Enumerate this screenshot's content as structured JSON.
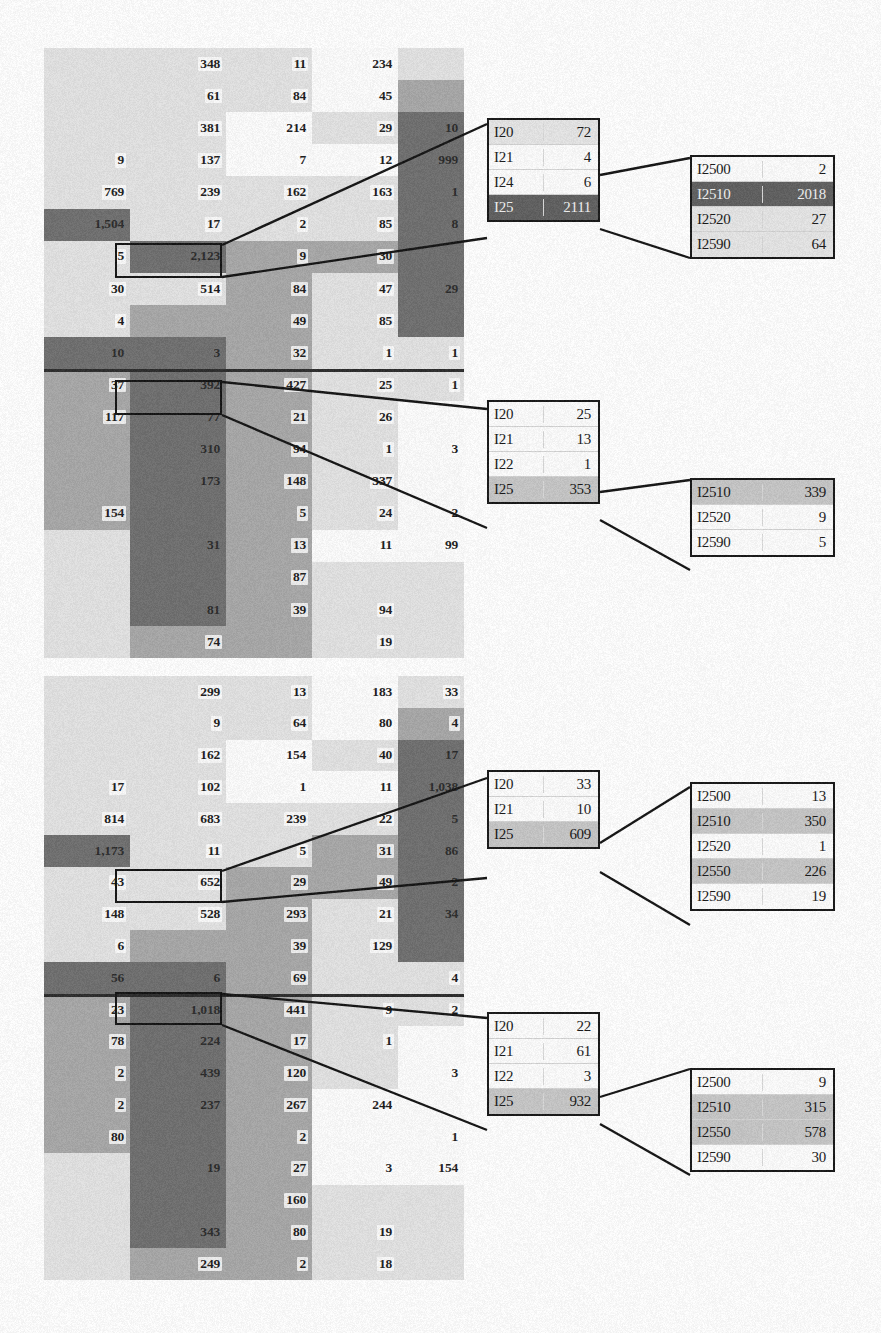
{
  "figure": {
    "palette": {
      "panel_bg": "#c9c9c9",
      "light": "#e3e3e3",
      "lighter": "#efefef",
      "white": "#fdfdfd",
      "mid": "#b6b6b6",
      "midgray": "#a8a8a8",
      "dark": "#6f6f6f",
      "darker": "#5d5d5d",
      "ink": "#161616",
      "highlight_border": "#111111"
    }
  },
  "panels": [
    {
      "name": "top-panel",
      "rows": 17,
      "cols": 5,
      "divider_after_row": 10,
      "grid": [
        [
          "",
          "348",
          "11",
          "234",
          ""
        ],
        [
          "",
          "61",
          "84",
          "45",
          ""
        ],
        [
          "",
          "381",
          "214",
          "29",
          "10"
        ],
        [
          "9",
          "137",
          "7",
          "12",
          "999"
        ],
        [
          "769",
          "239",
          "162",
          "163",
          "1"
        ],
        [
          "1,504",
          "17",
          "2",
          "85",
          "8"
        ],
        [
          "5",
          "2,123",
          "9",
          "30",
          ""
        ],
        [
          "30",
          "514",
          "84",
          "47",
          "29"
        ],
        [
          "4",
          "",
          "49",
          "85",
          ""
        ],
        [
          "10",
          "3",
          "32",
          "1",
          "1"
        ],
        [
          "37",
          "392",
          "427",
          "25",
          "1"
        ],
        [
          "117",
          "77",
          "21",
          "26",
          ""
        ],
        [
          "",
          "310",
          "94",
          "1",
          "3"
        ],
        [
          "",
          "173",
          "148",
          "337",
          ""
        ],
        [
          "154",
          "",
          "5",
          "24",
          "2"
        ],
        [
          "",
          "31",
          "13",
          "11",
          "99"
        ],
        [
          "",
          "",
          "87",
          "",
          ""
        ],
        [
          "",
          "81",
          "39",
          "94",
          ""
        ],
        [
          "",
          "74",
          "",
          "19",
          ""
        ]
      ]
    },
    {
      "name": "bottom-panel",
      "rows": 17,
      "cols": 5,
      "divider_after_row": 10,
      "grid": [
        [
          "",
          "299",
          "13",
          "183",
          "33"
        ],
        [
          "",
          "9",
          "64",
          "80",
          "4"
        ],
        [
          "",
          "162",
          "154",
          "40",
          "17"
        ],
        [
          "17",
          "102",
          "1",
          "11",
          "1,038"
        ],
        [
          "814",
          "683",
          "239",
          "22",
          "5"
        ],
        [
          "1,173",
          "11",
          "5",
          "31",
          "86"
        ],
        [
          "43",
          "652",
          "29",
          "49",
          "2"
        ],
        [
          "148",
          "528",
          "293",
          "21",
          "34"
        ],
        [
          "6",
          "",
          "39",
          "129",
          ""
        ],
        [
          "56",
          "6",
          "69",
          "",
          "4"
        ],
        [
          "23",
          "1,018",
          "441",
          "9",
          "2"
        ],
        [
          "78",
          "224",
          "17",
          "1",
          ""
        ],
        [
          "2",
          "439",
          "120",
          "",
          "3"
        ],
        [
          "2",
          "237",
          "267",
          "244",
          ""
        ],
        [
          "80",
          "",
          "2",
          "",
          "1"
        ],
        [
          "",
          "19",
          "27",
          "3",
          "154"
        ],
        [
          "",
          "",
          "160",
          "",
          ""
        ],
        [
          "",
          "343",
          "80",
          "19",
          ""
        ],
        [
          "",
          "249",
          "2",
          "18",
          ""
        ]
      ]
    }
  ],
  "callouts": [
    {
      "name": "callout-top-level1",
      "rows": [
        {
          "key": "I20",
          "value": "72",
          "shade": "light"
        },
        {
          "key": "I21",
          "value": "4",
          "shade": "white"
        },
        {
          "key": "I24",
          "value": "6",
          "shade": "white"
        },
        {
          "key": "I25",
          "value": "2111",
          "shade": "dark"
        }
      ]
    },
    {
      "name": "callout-top-level2",
      "rows": [
        {
          "key": "I2500",
          "value": "2",
          "shade": "white"
        },
        {
          "key": "I2510",
          "value": "2018",
          "shade": "dark"
        },
        {
          "key": "I2520",
          "value": "27",
          "shade": "light"
        },
        {
          "key": "I2590",
          "value": "64",
          "shade": "light"
        }
      ]
    },
    {
      "name": "callout-mid-level1",
      "rows": [
        {
          "key": "I20",
          "value": "25",
          "shade": "white"
        },
        {
          "key": "I21",
          "value": "13",
          "shade": "white"
        },
        {
          "key": "I22",
          "value": "1",
          "shade": "white"
        },
        {
          "key": "I25",
          "value": "353",
          "shade": "mid"
        }
      ]
    },
    {
      "name": "callout-mid-level2",
      "rows": [
        {
          "key": "I2510",
          "value": "339",
          "shade": "mid"
        },
        {
          "key": "I2520",
          "value": "9",
          "shade": "white"
        },
        {
          "key": "I2590",
          "value": "5",
          "shade": "white"
        }
      ]
    },
    {
      "name": "callout-lower-level1",
      "rows": [
        {
          "key": "I20",
          "value": "33",
          "shade": "white"
        },
        {
          "key": "I21",
          "value": "10",
          "shade": "white"
        },
        {
          "key": "I25",
          "value": "609",
          "shade": "mid"
        }
      ]
    },
    {
      "name": "callout-lower-level2",
      "rows": [
        {
          "key": "I2500",
          "value": "13",
          "shade": "white"
        },
        {
          "key": "I2510",
          "value": "350",
          "shade": "mid"
        },
        {
          "key": "I2520",
          "value": "1",
          "shade": "white"
        },
        {
          "key": "I2550",
          "value": "226",
          "shade": "mid"
        },
        {
          "key": "I2590",
          "value": "19",
          "shade": "white"
        }
      ]
    },
    {
      "name": "callout-bottom-level1",
      "rows": [
        {
          "key": "I20",
          "value": "22",
          "shade": "white"
        },
        {
          "key": "I21",
          "value": "61",
          "shade": "white"
        },
        {
          "key": "I22",
          "value": "3",
          "shade": "white"
        },
        {
          "key": "I25",
          "value": "932",
          "shade": "mid"
        }
      ]
    },
    {
      "name": "callout-bottom-level2",
      "rows": [
        {
          "key": "I2500",
          "value": "9",
          "shade": "white"
        },
        {
          "key": "I2510",
          "value": "315",
          "shade": "mid"
        },
        {
          "key": "I2550",
          "value": "578",
          "shade": "mid"
        },
        {
          "key": "I2590",
          "value": "30",
          "shade": "white"
        }
      ]
    }
  ],
  "chart_data": {
    "type": "heatmap",
    "xlabel": "",
    "ylabel": "",
    "grid": true,
    "legend_position": "none",
    "panels": [
      {
        "name": "top-panel",
        "columns": [
          "c1",
          "c2",
          "c3",
          "c4",
          "c5"
        ],
        "values": [
          [
            null,
            348,
            11,
            234,
            null
          ],
          [
            null,
            61,
            84,
            45,
            null
          ],
          [
            null,
            381,
            214,
            29,
            10
          ],
          [
            9,
            137,
            7,
            12,
            999
          ],
          [
            769,
            239,
            162,
            163,
            1
          ],
          [
            1504,
            17,
            2,
            85,
            8
          ],
          [
            5,
            2123,
            9,
            30,
            null
          ],
          [
            30,
            514,
            84,
            47,
            29
          ],
          [
            4,
            null,
            49,
            85,
            null
          ],
          [
            10,
            3,
            32,
            1,
            1
          ],
          [
            37,
            392,
            427,
            25,
            1
          ],
          [
            117,
            77,
            21,
            26,
            null
          ],
          [
            null,
            310,
            94,
            1,
            3
          ],
          [
            null,
            173,
            148,
            337,
            null
          ],
          [
            154,
            null,
            5,
            24,
            2
          ],
          [
            null,
            31,
            13,
            11,
            99
          ],
          [
            null,
            null,
            87,
            null,
            null
          ],
          [
            null,
            81,
            39,
            94,
            null
          ],
          [
            null,
            74,
            null,
            19,
            null
          ]
        ],
        "highlighted_cell": {
          "row": 6,
          "col": 1,
          "value": 2123
        }
      },
      {
        "name": "bottom-panel",
        "columns": [
          "c1",
          "c2",
          "c3",
          "c4",
          "c5"
        ],
        "values": [
          [
            null,
            299,
            13,
            183,
            33
          ],
          [
            null,
            9,
            64,
            80,
            4
          ],
          [
            null,
            162,
            154,
            40,
            17
          ],
          [
            17,
            102,
            1,
            11,
            1038
          ],
          [
            814,
            683,
            239,
            22,
            5
          ],
          [
            1173,
            11,
            5,
            31,
            86
          ],
          [
            43,
            652,
            29,
            49,
            2
          ],
          [
            148,
            528,
            293,
            21,
            34
          ],
          [
            6,
            null,
            39,
            129,
            null
          ],
          [
            56,
            6,
            69,
            null,
            4
          ],
          [
            23,
            1018,
            441,
            9,
            2
          ],
          [
            78,
            224,
            17,
            1,
            null
          ],
          [
            2,
            439,
            120,
            null,
            3
          ],
          [
            2,
            237,
            267,
            244,
            null
          ],
          [
            80,
            null,
            2,
            null,
            1
          ],
          [
            null,
            19,
            27,
            3,
            154
          ],
          [
            null,
            null,
            160,
            null,
            null
          ],
          [
            null,
            343,
            80,
            19,
            null
          ],
          [
            null,
            249,
            2,
            18,
            null
          ]
        ],
        "highlighted_cells": [
          {
            "row": 6,
            "col": 1,
            "value": 652
          },
          {
            "row": 10,
            "col": 1,
            "value": 1018
          }
        ]
      }
    ],
    "drilldowns": [
      {
        "from": "top-panel",
        "level1": {
          "I20": 72,
          "I21": 4,
          "I24": 6,
          "I25": 2111
        },
        "level2": {
          "I2500": 2,
          "I2510": 2018,
          "I2520": 27,
          "I2590": 64
        }
      },
      {
        "from": "top-panel",
        "level1": {
          "I20": 25,
          "I21": 13,
          "I22": 1,
          "I25": 353
        },
        "level2": {
          "I2510": 339,
          "I2520": 9,
          "I2590": 5
        }
      },
      {
        "from": "bottom-panel",
        "level1": {
          "I20": 33,
          "I21": 10,
          "I25": 609
        },
        "level2": {
          "I2500": 13,
          "I2510": 350,
          "I2520": 1,
          "I2550": 226,
          "I2590": 19
        }
      },
      {
        "from": "bottom-panel",
        "level1": {
          "I20": 22,
          "I21": 61,
          "I22": 3,
          "I25": 932
        },
        "level2": {
          "I2500": 9,
          "I2510": 315,
          "I2550": 578,
          "I2590": 30
        }
      }
    ]
  }
}
